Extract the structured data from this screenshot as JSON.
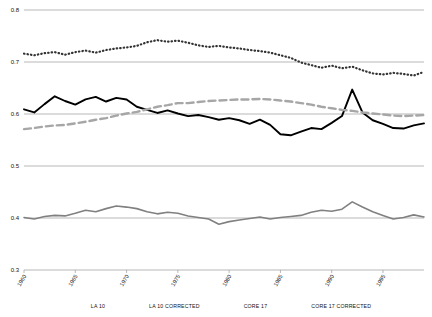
{
  "chart_data": {
    "type": "line",
    "title": "",
    "xlabel": "",
    "ylabel": "",
    "xlim": [
      1960,
      1999
    ],
    "ylim": [
      0.3,
      0.8
    ],
    "yticks": [
      "0.3",
      "0.4",
      "0.5",
      "0.6",
      "0.7",
      "0.8"
    ],
    "ytick_values": [
      0.3,
      0.4,
      0.5,
      0.6,
      0.7,
      0.8
    ],
    "xticks": [
      "1960",
      "1965",
      "1970",
      "1975",
      "1980",
      "1985",
      "1990",
      "1995"
    ],
    "xtick_values": [
      1960,
      1965,
      1970,
      1975,
      1980,
      1985,
      1990,
      1995
    ],
    "grid": "horizontal-gridlines-at-yticks",
    "legend_position": "bottom-center",
    "x": [
      1960,
      1961,
      1962,
      1963,
      1964,
      1965,
      1966,
      1967,
      1968,
      1969,
      1970,
      1971,
      1972,
      1973,
      1974,
      1975,
      1976,
      1977,
      1978,
      1979,
      1980,
      1981,
      1982,
      1983,
      1984,
      1985,
      1986,
      1987,
      1988,
      1989,
      1990,
      1991,
      1992,
      1993,
      1994,
      1995,
      1996,
      1997,
      1998,
      1999
    ],
    "series": [
      {
        "name": "LA 10",
        "color": "#808080",
        "style": "solid",
        "width": 1.6,
        "values": [
          0.401,
          0.398,
          0.403,
          0.405,
          0.404,
          0.409,
          0.415,
          0.412,
          0.418,
          0.423,
          0.421,
          0.418,
          0.412,
          0.408,
          0.411,
          0.409,
          0.404,
          0.401,
          0.398,
          0.388,
          0.393,
          0.396,
          0.399,
          0.402,
          0.398,
          0.401,
          0.403,
          0.405,
          0.411,
          0.415,
          0.413,
          0.417,
          0.431,
          0.421,
          0.412,
          0.405,
          0.398,
          0.401,
          0.406,
          0.402
        ]
      },
      {
        "name": "LA 10 CORRECTED",
        "color": "#000000",
        "style": "solid",
        "width": 1.9,
        "values": [
          0.609,
          0.603,
          0.619,
          0.634,
          0.625,
          0.618,
          0.628,
          0.633,
          0.624,
          0.631,
          0.628,
          0.614,
          0.608,
          0.602,
          0.607,
          0.601,
          0.596,
          0.598,
          0.594,
          0.589,
          0.592,
          0.588,
          0.581,
          0.589,
          0.579,
          0.561,
          0.559,
          0.566,
          0.573,
          0.571,
          0.583,
          0.596,
          0.647,
          0.603,
          0.588,
          0.581,
          0.573,
          0.572,
          0.578,
          0.582
        ]
      },
      {
        "name": "CORE 17",
        "color": "#a6a6a6",
        "style": "dashed",
        "width": 2.4,
        "values": [
          0.571,
          0.573,
          0.576,
          0.578,
          0.579,
          0.582,
          0.585,
          0.589,
          0.592,
          0.597,
          0.601,
          0.604,
          0.609,
          0.614,
          0.617,
          0.621,
          0.621,
          0.623,
          0.625,
          0.626,
          0.627,
          0.628,
          0.628,
          0.629,
          0.628,
          0.626,
          0.624,
          0.621,
          0.618,
          0.614,
          0.611,
          0.608,
          0.606,
          0.603,
          0.601,
          0.599,
          0.597,
          0.596,
          0.597,
          0.598
        ]
      },
      {
        "name": "CORE 17 CORRECTED",
        "color": "#333333",
        "style": "dotted",
        "width": 2.2,
        "values": [
          0.716,
          0.713,
          0.717,
          0.719,
          0.714,
          0.719,
          0.722,
          0.718,
          0.723,
          0.726,
          0.728,
          0.731,
          0.738,
          0.742,
          0.739,
          0.741,
          0.737,
          0.732,
          0.729,
          0.731,
          0.728,
          0.726,
          0.723,
          0.721,
          0.718,
          0.713,
          0.708,
          0.699,
          0.694,
          0.689,
          0.693,
          0.688,
          0.691,
          0.684,
          0.678,
          0.676,
          0.679,
          0.677,
          0.674,
          0.681
        ]
      }
    ]
  },
  "legend": {
    "items": [
      {
        "label": "LA 10",
        "color": "#808080",
        "style": "solid"
      },
      {
        "label": "LA 10 CORRECTED",
        "color": "#000000",
        "style": "solid"
      },
      {
        "label": "CORE 17",
        "color": "#a6a6a6",
        "style": "dashed"
      },
      {
        "label": "CORE 17 CORRECTED",
        "color": "#333333",
        "style": "dotted"
      }
    ]
  }
}
